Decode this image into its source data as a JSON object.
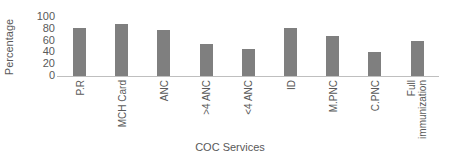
{
  "chart_data": {
    "type": "bar",
    "title": "",
    "xlabel": "COC Services",
    "ylabel": "Percentage",
    "ylim": [
      0,
      100
    ],
    "yticks": [
      0,
      20,
      40,
      60,
      80,
      100
    ],
    "grid": false,
    "legend": null,
    "bar_color": "#7f7f7f",
    "categories": [
      "P.R",
      "MCH Card",
      "ANC",
      ">4 ANC",
      "<4 ANC",
      "ID",
      "M.PNC",
      "C.PNC",
      "Full immunization"
    ],
    "category_display": [
      "P.R",
      "MCH Card",
      "ANC",
      ">4 ANC",
      "<4 ANC",
      "ID",
      "M.PNC",
      "C.PNC",
      "Full\nimmunization"
    ],
    "values": [
      82,
      88,
      78,
      55,
      46,
      81,
      68,
      41,
      60
    ]
  },
  "axis": {
    "y_title": "Percentage",
    "x_title": "COC Services",
    "y_ticks": [
      "100",
      "80",
      "60",
      "40",
      "20",
      "0"
    ]
  }
}
